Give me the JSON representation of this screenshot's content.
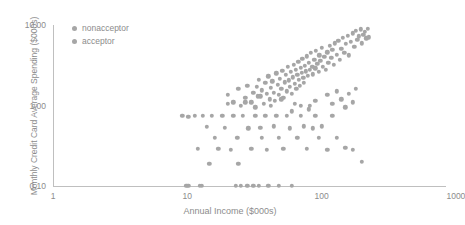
{
  "chart_data": {
    "type": "scatter",
    "title": "",
    "xlabel": "Annual Income ($000s)",
    "ylabel": "Monthly Credit Card Average Spending ($000s)",
    "xscale": "log",
    "yscale": "log",
    "xlim": [
      1,
      1000
    ],
    "ylim": [
      0.1,
      10.0
    ],
    "xticks": [
      "1",
      "10",
      "100",
      "1000"
    ],
    "xtick_values": [
      1,
      10,
      100,
      1000
    ],
    "yticks": [
      "0.10",
      "1.00",
      "10.00"
    ],
    "ytick_values": [
      0.1,
      1.0,
      10.0
    ],
    "grid": false,
    "legend_position": "top-left-inside",
    "marker_color": "#a6a6a6",
    "axis_color": "#bfbfbf",
    "text_color": "#8c8c8c",
    "series": [
      {
        "name": "nonacceptor",
        "color": "#a6a6a6",
        "points": [
          [
            9.2,
            0.75
          ],
          [
            9.8,
            0.1
          ],
          [
            10.2,
            0.72
          ],
          [
            11.4,
            0.74
          ],
          [
            12.0,
            0.29
          ],
          [
            12.4,
            0.1
          ],
          [
            13.0,
            0.75
          ],
          [
            14.0,
            0.54
          ],
          [
            14.6,
            0.19
          ],
          [
            15.2,
            0.75
          ],
          [
            16.0,
            0.4
          ],
          [
            17.0,
            0.29
          ],
          [
            18.2,
            0.75
          ],
          [
            19.0,
            0.53
          ],
          [
            20.0,
            1.05
          ],
          [
            21.0,
            0.28
          ],
          [
            22.0,
            0.75
          ],
          [
            23.5,
            0.4
          ],
          [
            24.0,
            0.19
          ],
          [
            25.0,
            0.1
          ],
          [
            26.0,
            0.75
          ],
          [
            27.0,
            1.1
          ],
          [
            28.5,
            0.52
          ],
          [
            30.0,
            0.29
          ],
          [
            31.0,
            0.1
          ],
          [
            32.0,
            0.75
          ],
          [
            33.5,
            1.3
          ],
          [
            35.0,
            0.53
          ],
          [
            36.0,
            0.4
          ],
          [
            38.0,
            0.75
          ],
          [
            39.0,
            0.28
          ],
          [
            40.0,
            0.1
          ],
          [
            42.0,
            1.0
          ],
          [
            44.0,
            0.55
          ],
          [
            46.0,
            0.75
          ],
          [
            48.0,
            0.4
          ],
          [
            50.0,
            1.2
          ],
          [
            52.0,
            0.29
          ],
          [
            55.0,
            0.75
          ],
          [
            58.0,
            0.52
          ],
          [
            60.0,
            0.1
          ],
          [
            63.0,
            1.05
          ],
          [
            66.0,
            0.4
          ],
          [
            70.0,
            0.75
          ],
          [
            74.0,
            0.55
          ],
          [
            78.0,
            0.29
          ],
          [
            82.0,
            1.0
          ],
          [
            86.0,
            0.52
          ],
          [
            90.0,
            0.75
          ],
          [
            95.0,
            0.4
          ],
          [
            100.0,
            0.55
          ],
          [
            110.0,
            0.28
          ],
          [
            120.0,
            0.75
          ],
          [
            130.0,
            0.4
          ],
          [
            150.0,
            0.3
          ],
          [
            170.0,
            0.28
          ],
          [
            200.0,
            0.2
          ]
        ]
      },
      {
        "name": "acceptor",
        "color": "#a6a6a6",
        "points": [
          [
            20.0,
            1.35
          ],
          [
            22.0,
            1.1
          ],
          [
            24.0,
            1.6
          ],
          [
            25.0,
            1.0
          ],
          [
            27.0,
            1.25
          ],
          [
            28.0,
            1.75
          ],
          [
            30.0,
            1.1
          ],
          [
            31.0,
            1.45
          ],
          [
            32.0,
            0.95
          ],
          [
            33.0,
            1.7
          ],
          [
            34.0,
            2.1
          ],
          [
            35.0,
            1.3
          ],
          [
            36.0,
            1.55
          ],
          [
            37.0,
            1.05
          ],
          [
            38.0,
            1.9
          ],
          [
            39.0,
            1.4
          ],
          [
            40.0,
            2.3
          ],
          [
            41.0,
            1.2
          ],
          [
            42.0,
            1.65
          ],
          [
            43.0,
            2.0
          ],
          [
            44.0,
            1.45
          ],
          [
            45.0,
            1.15
          ],
          [
            46.0,
            2.5
          ],
          [
            47.0,
            1.8
          ],
          [
            48.0,
            1.35
          ],
          [
            49.0,
            2.15
          ],
          [
            50.0,
            1.6
          ],
          [
            51.0,
            2.7
          ],
          [
            52.0,
            1.25
          ],
          [
            53.0,
            1.95
          ],
          [
            54.0,
            2.4
          ],
          [
            55.0,
            1.5
          ],
          [
            56.0,
            3.0
          ],
          [
            57.0,
            2.05
          ],
          [
            58.0,
            1.7
          ],
          [
            59.0,
            2.6
          ],
          [
            60.0,
            1.4
          ],
          [
            61.0,
            2.25
          ],
          [
            62.0,
            3.2
          ],
          [
            63.0,
            1.85
          ],
          [
            64.0,
            2.8
          ],
          [
            65.0,
            1.6
          ],
          [
            66.0,
            2.4
          ],
          [
            67.0,
            3.5
          ],
          [
            68.0,
            2.1
          ],
          [
            69.0,
            1.75
          ],
          [
            70.0,
            2.95
          ],
          [
            71.0,
            2.55
          ],
          [
            72.0,
            3.8
          ],
          [
            73.0,
            2.2
          ],
          [
            74.0,
            1.9
          ],
          [
            75.0,
            3.1
          ],
          [
            76.0,
            2.65
          ],
          [
            78.0,
            4.1
          ],
          [
            79.0,
            2.35
          ],
          [
            80.0,
            3.4
          ],
          [
            82.0,
            2.8
          ],
          [
            83.0,
            4.5
          ],
          [
            85.0,
            3.0
          ],
          [
            86.0,
            2.45
          ],
          [
            88.0,
            3.7
          ],
          [
            90.0,
            2.9
          ],
          [
            91.0,
            4.8
          ],
          [
            93.0,
            3.3
          ],
          [
            95.0,
            2.6
          ],
          [
            96.0,
            4.2
          ],
          [
            98.0,
            3.6
          ],
          [
            100.0,
            5.2
          ],
          [
            102.0,
            3.05
          ],
          [
            105.0,
            4.0
          ],
          [
            107.0,
            2.8
          ],
          [
            110.0,
            4.6
          ],
          [
            112.0,
            3.4
          ],
          [
            115.0,
            5.5
          ],
          [
            118.0,
            3.9
          ],
          [
            120.0,
            4.9
          ],
          [
            123.0,
            3.2
          ],
          [
            126.0,
            5.9
          ],
          [
            130.0,
            4.3
          ],
          [
            133.0,
            6.4
          ],
          [
            136.0,
            3.7
          ],
          [
            140.0,
            5.1
          ],
          [
            144.0,
            6.9
          ],
          [
            148.0,
            4.5
          ],
          [
            152.0,
            5.8
          ],
          [
            156.0,
            7.4
          ],
          [
            160.0,
            4.2
          ],
          [
            165.0,
            6.2
          ],
          [
            170.0,
            7.9
          ],
          [
            175.0,
            5.4
          ],
          [
            180.0,
            8.4
          ],
          [
            185.0,
            6.6
          ],
          [
            190.0,
            7.2
          ],
          [
            195.0,
            8.8
          ],
          [
            200.0,
            5.9
          ],
          [
            205.0,
            7.6
          ],
          [
            210.0,
            8.2
          ],
          [
            215.0,
            6.8
          ],
          [
            220.0,
            9.0
          ],
          [
            225.0,
            7.0
          ],
          [
            110.0,
            1.35
          ],
          [
            120.0,
            1.05
          ],
          [
            130.0,
            1.5
          ],
          [
            140.0,
            1.2
          ],
          [
            150.0,
            0.95
          ],
          [
            160.0,
            1.4
          ],
          [
            170.0,
            1.1
          ],
          [
            180.0,
            1.6
          ],
          [
            60.0,
            0.85
          ],
          [
            70.0,
            1.0
          ],
          [
            80.0,
            0.9
          ],
          [
            90.0,
            1.15
          ]
        ]
      }
    ],
    "baseline_points": {
      "note": "points lying on the 0.10 axis floor",
      "x_values": [
        10.2,
        12.8,
        23.0,
        28.0,
        34.0,
        48.0
      ]
    }
  },
  "legend": {
    "items": [
      {
        "label": "nonacceptor"
      },
      {
        "label": "acceptor"
      }
    ]
  },
  "axes": {
    "x": {
      "label": "Annual Income ($000s)"
    },
    "y": {
      "label": "Monthly Credit Card Average Spending ($000s)"
    }
  }
}
